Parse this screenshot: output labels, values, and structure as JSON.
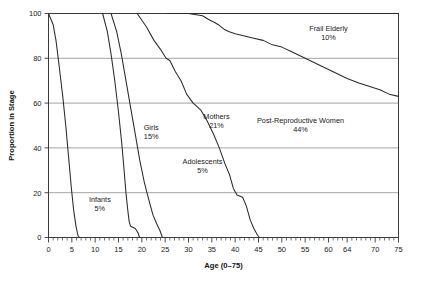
{
  "chart_data": {
    "type": "line",
    "title": "",
    "xlabel": "Age (0–75)",
    "ylabel": "Proportion in Stage",
    "xlim": [
      0,
      75
    ],
    "ylim": [
      0,
      100
    ],
    "grid": true,
    "legend": "none (inline annotations)",
    "x_ticks": [
      0,
      5,
      10,
      15,
      20,
      25,
      30,
      35,
      40,
      45,
      50,
      55,
      60,
      64,
      70,
      75
    ],
    "x_tick_labels": [
      "0",
      "5",
      "10",
      "15",
      "20",
      "25",
      "30",
      "35",
      "40",
      "45",
      "50",
      "55",
      "60",
      "64",
      "70",
      "75"
    ],
    "x_minor_tick_step": 1,
    "y_ticks": [
      0,
      20,
      40,
      60,
      80,
      100
    ],
    "y_tick_labels": [
      "0",
      "20",
      "40",
      "60",
      "80",
      "100"
    ],
    "series": [
      {
        "name": "Infants",
        "percent_label": "5%",
        "label_text": "Infants",
        "label_pct": "5%",
        "points": [
          [
            0,
            100
          ],
          [
            1.0,
            95
          ],
          [
            1.6,
            88
          ],
          [
            2.2,
            78
          ],
          [
            3.0,
            64
          ],
          [
            3.7,
            50
          ],
          [
            4.3,
            36
          ],
          [
            4.9,
            22
          ],
          [
            5.4,
            12
          ],
          [
            5.9,
            5
          ],
          [
            6.3,
            1
          ],
          [
            6.6,
            0
          ]
        ]
      },
      {
        "name": "Girls",
        "percent_label": "15%",
        "label_text": "Girls",
        "label_pct": "15%",
        "points": [
          [
            11.6,
            100
          ],
          [
            12.6,
            92
          ],
          [
            13.4,
            82
          ],
          [
            14.2,
            70
          ],
          [
            15.0,
            56
          ],
          [
            15.7,
            42
          ],
          [
            16.2,
            30
          ],
          [
            16.6,
            20
          ],
          [
            17.0,
            12
          ],
          [
            17.3,
            7
          ],
          [
            17.6,
            5
          ],
          [
            18.6,
            4
          ],
          [
            19.2,
            2
          ],
          [
            19.5,
            0
          ]
        ]
      },
      {
        "name": "Adolescents",
        "percent_label": "5%",
        "label_text": "Adolescents",
        "label_pct": "5%",
        "points": [
          [
            13.4,
            100
          ],
          [
            14.6,
            92
          ],
          [
            15.6,
            82
          ],
          [
            16.6,
            70
          ],
          [
            17.6,
            58
          ],
          [
            18.6,
            46
          ],
          [
            19.6,
            34
          ],
          [
            20.6,
            24
          ],
          [
            21.6,
            16
          ],
          [
            22.4,
            10
          ],
          [
            23.2,
            6
          ],
          [
            23.9,
            3
          ],
          [
            24.4,
            0
          ]
        ]
      },
      {
        "name": "Mothers",
        "percent_label": "21%",
        "label_text": "Mothers",
        "label_pct": "21%",
        "points": [
          [
            19.0,
            100
          ],
          [
            21.0,
            94
          ],
          [
            22.6,
            88
          ],
          [
            24.0,
            84
          ],
          [
            25.2,
            80
          ],
          [
            26.0,
            79
          ],
          [
            27.2,
            74
          ],
          [
            28.4,
            70
          ],
          [
            29.6,
            64
          ],
          [
            31.0,
            60
          ],
          [
            32.6,
            57
          ],
          [
            34.0,
            52
          ],
          [
            35.4,
            46
          ],
          [
            36.6,
            40
          ],
          [
            37.8,
            33
          ],
          [
            38.8,
            28
          ],
          [
            39.6,
            22
          ],
          [
            40.4,
            19
          ],
          [
            41.6,
            18
          ],
          [
            42.4,
            14
          ],
          [
            43.2,
            8
          ],
          [
            44.0,
            4
          ],
          [
            44.8,
            1
          ],
          [
            45.2,
            0
          ]
        ]
      },
      {
        "name": "Post-Reproductive Women",
        "percent_label": "44%",
        "label_text": "Post-Reproductive Women",
        "label_pct": "44%",
        "points": [
          [
            25.4,
            100
          ],
          [
            30.0,
            100
          ],
          [
            33.0,
            99
          ],
          [
            34.6,
            97
          ],
          [
            35.6,
            96
          ],
          [
            36.4,
            95
          ],
          [
            37.0,
            94
          ],
          [
            37.6,
            93
          ],
          [
            38.6,
            92
          ],
          [
            40.0,
            91
          ],
          [
            42.0,
            90
          ],
          [
            44.0,
            89
          ],
          [
            46.0,
            88
          ],
          [
            48.0,
            86
          ],
          [
            50.0,
            85
          ],
          [
            52.0,
            83
          ],
          [
            55.0,
            80
          ],
          [
            58.0,
            77
          ],
          [
            61.0,
            74
          ],
          [
            64.0,
            71
          ],
          [
            66.5,
            69
          ],
          [
            68.0,
            68
          ],
          [
            69.5,
            67
          ],
          [
            71.0,
            66
          ],
          [
            73.0,
            64
          ],
          [
            75.0,
            63
          ]
        ]
      },
      {
        "name": "Frail Elderly",
        "percent_label": "10%",
        "label_text": "Frail Elderly",
        "label_pct": "10%",
        "points": [
          [
            30.0,
            100
          ],
          [
            75.0,
            100
          ]
        ]
      }
    ],
    "annotations": [
      {
        "id": "infants",
        "text": "Infants",
        "pct": "5%",
        "x": 11,
        "y": 16
      },
      {
        "id": "girls",
        "text": "Girls",
        "pct": "15%",
        "x": 22,
        "y": 48
      },
      {
        "id": "adolesc",
        "text": "Adolescents",
        "pct": "5%",
        "x": 33,
        "y": 33
      },
      {
        "id": "mothers",
        "text": "Mothers",
        "pct": "21%",
        "x": 36,
        "y": 53
      },
      {
        "id": "postrep",
        "text": "Post-Reproductive Women",
        "pct": "44%",
        "x": 54,
        "y": 51
      },
      {
        "id": "frail",
        "text": "Frail Elderly",
        "pct": "10%",
        "x": 60,
        "y": 92
      }
    ]
  },
  "colors": {
    "background": "#ffffff",
    "curve": "#2b2b2b",
    "grid": "#8c8c8c",
    "frame": "#3a3a3a",
    "text": "#1a1a1a"
  }
}
